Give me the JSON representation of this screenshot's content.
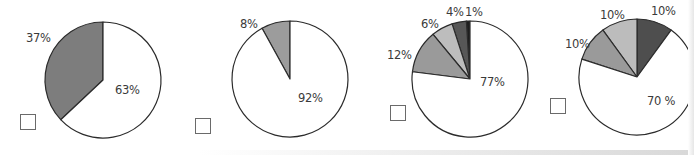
{
  "chart_data": [
    {
      "type": "pie",
      "title": "",
      "labels": [
        "37%",
        "63%"
      ],
      "values": [
        37,
        63
      ],
      "colors": [
        "#7d7d7d",
        "#ffffff"
      ],
      "center": [
        103,
        80
      ],
      "radius": 58,
      "start": "top",
      "direction": "counterclockwise-first-slice"
    },
    {
      "type": "pie",
      "title": "",
      "labels": [
        "8%",
        "92%"
      ],
      "values": [
        8,
        92
      ],
      "colors": [
        "#9c9c9c",
        "#ffffff"
      ],
      "center": [
        290,
        79
      ],
      "radius": 58
    },
    {
      "type": "pie",
      "title": "",
      "labels": [
        "1%",
        "4%",
        "6%",
        "12%",
        "77%"
      ],
      "values": [
        1,
        4,
        6,
        12,
        77
      ],
      "colors": [
        "#1e1e1e",
        "#575757",
        "#bdbdbd",
        "#9a9a9a",
        "#ffffff"
      ],
      "center": [
        470,
        79
      ],
      "radius": 58
    },
    {
      "type": "pie",
      "title": "",
      "labels": [
        "10%",
        "10%",
        "10%",
        "70 %"
      ],
      "values": [
        10,
        10,
        10,
        70
      ],
      "colors": [
        "#4e4e4e",
        "#bcbcbc",
        "#9a9a9a",
        "#ffffff"
      ],
      "center": [
        637,
        77
      ],
      "radius": 58
    }
  ],
  "charts": [
    {
      "labels": [
        {
          "text": "37%",
          "x": 26,
          "y": 31
        },
        {
          "text": "63%",
          "x": 115,
          "y": 83
        }
      ],
      "checkbox": {
        "x": 20,
        "y": 114
      }
    },
    {
      "labels": [
        {
          "text": "8%",
          "x": 240,
          "y": 17
        },
        {
          "text": "92%",
          "x": 298,
          "y": 91
        }
      ],
      "checkbox": {
        "x": 195,
        "y": 118
      }
    },
    {
      "labels": [
        {
          "text": "4%",
          "x": 446,
          "y": 5
        },
        {
          "text": "1%",
          "x": 465,
          "y": 5
        },
        {
          "text": "6%",
          "x": 421,
          "y": 17
        },
        {
          "text": "12%",
          "x": 387,
          "y": 48
        },
        {
          "text": "77%",
          "x": 480,
          "y": 75
        }
      ],
      "checkbox": {
        "x": 390,
        "y": 105
      }
    },
    {
      "labels": [
        {
          "text": "10%",
          "x": 600,
          "y": 8
        },
        {
          "text": "10%",
          "x": 651,
          "y": 4
        },
        {
          "text": "10%",
          "x": 565,
          "y": 37
        },
        {
          "text": "70 %",
          "x": 647,
          "y": 94
        }
      ],
      "checkbox": {
        "x": 550,
        "y": 98
      }
    }
  ]
}
